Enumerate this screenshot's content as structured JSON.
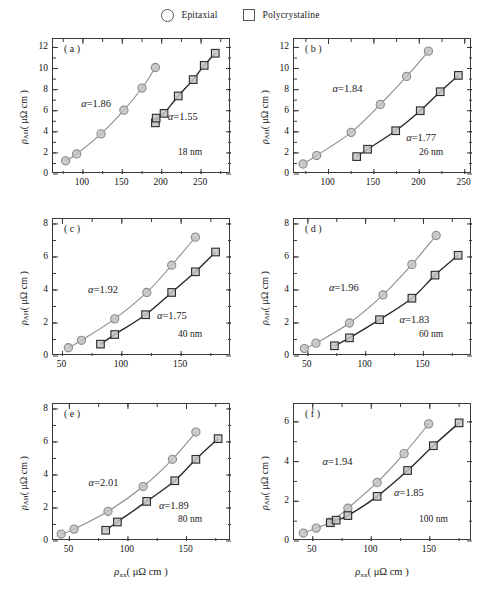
{
  "legend": {
    "entries": [
      {
        "label": "Epitaxial",
        "marker": "circle-marker-icon"
      },
      {
        "label": "Polycrystaline",
        "marker": "square-marker-icon"
      }
    ]
  },
  "axis_titles": {
    "x": "ρxx( μΩ cm )",
    "y": "ρAH( μΩ cm )",
    "x_symbol": "ρ",
    "x_sub": "xx",
    "x_unit": "( μΩ cm )",
    "y_symbol": "ρ",
    "y_sub": "AH",
    "y_unit": "( μΩ cm )"
  },
  "chart_data": [
    {
      "type": "scatter",
      "panel": "(a)",
      "title": "",
      "thickness_label": "18 nm",
      "xlabel": "ρxx( μΩ cm )",
      "ylabel": "ρAH( μΩ cm )",
      "xlim": [
        62,
        288
      ],
      "ylim": [
        0,
        12.8
      ],
      "xticks": [
        100,
        150,
        200,
        250
      ],
      "yticks": [
        0,
        2,
        4,
        6,
        8,
        10,
        12
      ],
      "grid": false,
      "annotations": [
        {
          "text": "α=1.86",
          "x": 118,
          "y": 6.6
        },
        {
          "text": "α=1.55",
          "x": 228,
          "y": 5.4
        }
      ],
      "series": [
        {
          "name": "Epitaxial",
          "marker": "circle",
          "color": "#8c8c8c",
          "x": [
            78,
            92,
            123,
            152,
            175,
            192
          ],
          "y": [
            1.25,
            1.9,
            3.8,
            6.05,
            8.15,
            10.1
          ]
        },
        {
          "name": "Polycrystaline",
          "marker": "square",
          "color": "#2b2b2b",
          "x": [
            192,
            193,
            203,
            221,
            240,
            254,
            268
          ],
          "y": [
            4.85,
            5.3,
            5.75,
            7.4,
            8.95,
            10.3,
            11.45
          ]
        }
      ]
    },
    {
      "type": "scatter",
      "panel": "(b)",
      "title": "",
      "thickness_label": "26 nm",
      "xlabel": "ρxx( μΩ cm )",
      "ylabel": "ρAH( μΩ cm )",
      "xlim": [
        62,
        258
      ],
      "ylim": [
        0,
        12.8
      ],
      "xticks": [
        100,
        150,
        200,
        250
      ],
      "yticks": [
        0,
        2,
        4,
        6,
        8,
        10,
        12
      ],
      "grid": false,
      "annotations": [
        {
          "text": "α=1.84",
          "x": 122,
          "y": 8.1
        },
        {
          "text": "α=1.77",
          "x": 203,
          "y": 3.4
        }
      ],
      "series": [
        {
          "name": "Epitaxial",
          "marker": "circle",
          "color": "#8c8c8c",
          "x": [
            72,
            87,
            125,
            157,
            186,
            210
          ],
          "y": [
            0.95,
            1.75,
            3.95,
            6.6,
            9.25,
            11.65
          ]
        },
        {
          "name": "Polycrystaline",
          "marker": "square",
          "color": "#2b2b2b",
          "x": [
            131,
            143,
            174,
            201,
            223,
            243
          ],
          "y": [
            1.65,
            2.35,
            4.1,
            6.0,
            7.8,
            9.35
          ]
        }
      ]
    },
    {
      "type": "scatter",
      "panel": "(c)",
      "title": "",
      "thickness_label": "40 nm",
      "xlabel": "ρxx( μΩ cm )",
      "ylabel": "ρAH( μΩ cm )",
      "xlim": [
        42,
        192
      ],
      "ylim": [
        0,
        8.3
      ],
      "xticks": [
        50,
        100,
        150
      ],
      "yticks": [
        0,
        2,
        4,
        6,
        8
      ],
      "grid": false,
      "annotations": [
        {
          "text": "α=1.92",
          "x": 85,
          "y": 4.0
        },
        {
          "text": "α=1.75",
          "x": 143,
          "y": 2.45
        }
      ],
      "series": [
        {
          "name": "Epitaxial",
          "marker": "circle",
          "color": "#8c8c8c",
          "x": [
            55,
            66,
            94,
            121,
            142,
            162
          ],
          "y": [
            0.5,
            0.95,
            2.25,
            3.85,
            5.5,
            7.2
          ]
        },
        {
          "name": "Polycrystaline",
          "marker": "square",
          "color": "#2b2b2b",
          "x": [
            82,
            94,
            120,
            142,
            162,
            179
          ],
          "y": [
            0.72,
            1.3,
            2.5,
            3.85,
            5.1,
            6.3
          ]
        }
      ]
    },
    {
      "type": "scatter",
      "panel": "(d)",
      "title": "",
      "thickness_label": "60 nm",
      "xlabel": "ρxx( μΩ cm )",
      "ylabel": "ρAH( μΩ cm )",
      "xlim": [
        38,
        192
      ],
      "ylim": [
        0,
        8.3
      ],
      "xticks": [
        50,
        100,
        150
      ],
      "yticks": [
        0,
        2,
        4,
        6,
        8
      ],
      "grid": false,
      "annotations": [
        {
          "text": "α=1.96",
          "x": 82,
          "y": 4.1
        },
        {
          "text": "α=1.83",
          "x": 143,
          "y": 2.2
        }
      ],
      "series": [
        {
          "name": "Epitaxial",
          "marker": "circle",
          "color": "#8c8c8c",
          "x": [
            47,
            57,
            86,
            115,
            140,
            161
          ],
          "y": [
            0.45,
            0.78,
            2.0,
            3.7,
            5.55,
            7.3
          ]
        },
        {
          "name": "Polycrystaline",
          "marker": "square",
          "color": "#2b2b2b",
          "x": [
            73,
            86,
            112,
            140,
            160,
            180
          ],
          "y": [
            0.62,
            1.1,
            2.2,
            3.5,
            4.9,
            6.1
          ]
        }
      ]
    },
    {
      "type": "scatter",
      "panel": "(e)",
      "title": "",
      "thickness_label": "80 nm",
      "xlabel": "ρxx( μΩ cm )",
      "ylabel": "ρAH( μΩ cm )",
      "xlim": [
        36,
        188
      ],
      "ylim": [
        0,
        8.3
      ],
      "xticks": [
        50,
        100,
        150
      ],
      "yticks": [
        0,
        2,
        4,
        6,
        8
      ],
      "grid": false,
      "annotations": [
        {
          "text": "α=2.01",
          "x": 80,
          "y": 3.5
        },
        {
          "text": "α=1.89",
          "x": 140,
          "y": 2.1
        }
      ],
      "series": [
        {
          "name": "Epitaxial",
          "marker": "circle",
          "color": "#8c8c8c",
          "x": [
            43,
            54,
            83,
            113,
            138,
            158
          ],
          "y": [
            0.42,
            0.72,
            1.8,
            3.3,
            4.95,
            6.6
          ]
        },
        {
          "name": "Polycrystaline",
          "marker": "square",
          "color": "#2b2b2b",
          "x": [
            81,
            91,
            116,
            140,
            158,
            177
          ],
          "y": [
            0.65,
            1.15,
            2.4,
            3.65,
            4.95,
            6.2
          ]
        }
      ]
    },
    {
      "type": "scatter",
      "panel": "(f)",
      "title": "",
      "thickness_label": "100 nm",
      "xlabel": "ρxx( μΩ cm )",
      "ylabel": "ρAH( μΩ cm )",
      "xlim": [
        34,
        186
      ],
      "ylim": [
        0,
        6.9
      ],
      "xticks": [
        50,
        100,
        150
      ],
      "yticks": [
        0,
        2,
        4,
        6
      ],
      "grid": false,
      "annotations": [
        {
          "text": "α=1.94",
          "x": 72,
          "y": 4.0
        },
        {
          "text": "α=1.85",
          "x": 133,
          "y": 2.4
        }
      ],
      "series": [
        {
          "name": "Epitaxial",
          "marker": "circle",
          "color": "#8c8c8c",
          "x": [
            42,
            53,
            65,
            80,
            105,
            128,
            149
          ],
          "y": [
            0.4,
            0.65,
            0.95,
            1.65,
            2.95,
            4.4,
            5.9
          ]
        },
        {
          "name": "Polycrystaline",
          "marker": "square",
          "color": "#2b2b2b",
          "x": [
            65,
            70,
            80,
            105,
            131,
            153,
            175
          ],
          "y": [
            0.92,
            1.05,
            1.28,
            2.25,
            3.55,
            4.8,
            5.95
          ]
        }
      ]
    }
  ]
}
